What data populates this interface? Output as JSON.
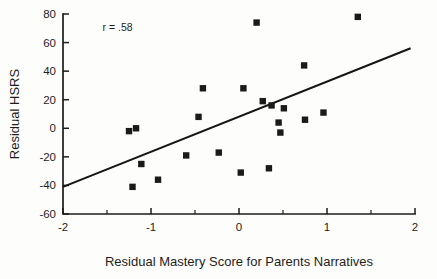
{
  "chart_data": {
    "type": "scatter",
    "title": "",
    "xlabel": "Residual Mastery Score for Parents Narratives",
    "ylabel": "Residual HSRS",
    "xlim": [
      -2,
      2
    ],
    "ylim": [
      -60,
      80
    ],
    "grid": false,
    "legend": "none",
    "annotations": [
      {
        "text": "r = .58",
        "x": -1.55,
        "y": 68
      }
    ],
    "xticks": [
      -2,
      -1,
      0,
      1,
      2
    ],
    "xtick_labels": [
      "-2",
      "-1",
      "0",
      "1",
      "2"
    ],
    "xticks_minor": [
      -1.5,
      -0.5,
      0.5,
      1.5
    ],
    "yticks": [
      80,
      60,
      40,
      20,
      0,
      -20,
      -40,
      -60
    ],
    "ytick_labels": [
      "80",
      "60",
      "40",
      "20",
      "0",
      "-20",
      "-40",
      "-60"
    ],
    "series": [
      {
        "name": "Participants",
        "marker": "square",
        "color": "#1a1a1a",
        "points": [
          {
            "x": -1.25,
            "y": -2
          },
          {
            "x": -1.17,
            "y": 0
          },
          {
            "x": -1.21,
            "y": -41
          },
          {
            "x": -1.11,
            "y": -25
          },
          {
            "x": -0.92,
            "y": -36
          },
          {
            "x": -0.6,
            "y": -19
          },
          {
            "x": -0.46,
            "y": 8
          },
          {
            "x": -0.41,
            "y": 28
          },
          {
            "x": -0.23,
            "y": -17
          },
          {
            "x": 0.02,
            "y": -31
          },
          {
            "x": 0.05,
            "y": 28
          },
          {
            "x": 0.2,
            "y": 74
          },
          {
            "x": 0.27,
            "y": 19
          },
          {
            "x": 0.34,
            "y": -28
          },
          {
            "x": 0.37,
            "y": 16
          },
          {
            "x": 0.45,
            "y": 4
          },
          {
            "x": 0.47,
            "y": -3
          },
          {
            "x": 0.51,
            "y": 14
          },
          {
            "x": 0.74,
            "y": 44
          },
          {
            "x": 0.75,
            "y": 6
          },
          {
            "x": 0.96,
            "y": 11
          },
          {
            "x": 1.35,
            "y": 78
          }
        ]
      }
    ],
    "fit_line": {
      "name": "regression-line",
      "x0": -2,
      "y0": -41,
      "x1": 1.95,
      "y1": 56
    }
  }
}
